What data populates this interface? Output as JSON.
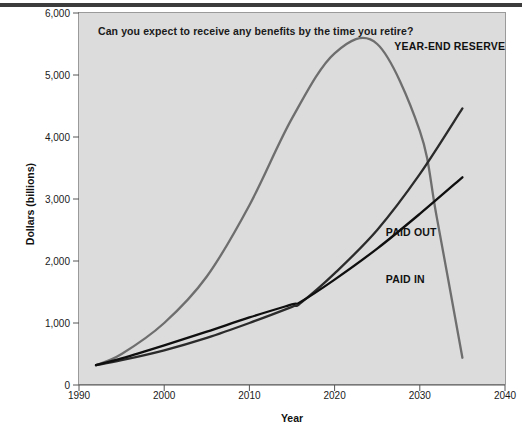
{
  "chart_data": {
    "type": "line",
    "title": "Can you expect to receive any benefits by the time you retire?",
    "xlabel": "Year",
    "ylabel": "Dollars (billions)",
    "xlim": [
      1990,
      2040
    ],
    "ylim": [
      0,
      6000
    ],
    "xticks": [
      1990,
      2000,
      2010,
      2020,
      2030,
      2040
    ],
    "xtick_labels": [
      "1990",
      "2000",
      "2010",
      "2020",
      "2030",
      "2040"
    ],
    "yticks": [
      0,
      1000,
      2000,
      3000,
      4000,
      5000,
      6000
    ],
    "ytick_labels": [
      "0",
      "1,000",
      "2,000",
      "3,000",
      "4,000",
      "5,000",
      "6,000"
    ],
    "grid": false,
    "legend_position": "inline-annotations",
    "series": [
      {
        "name": "YEAR-END RESERVE",
        "color": "#6e6e6e",
        "label_x": 2027,
        "label_y": 5450,
        "x": [
          1992,
          1995,
          2000,
          2005,
          2010,
          2015,
          2020,
          2025,
          2030,
          2032,
          2035
        ],
        "y": [
          320,
          500,
          1000,
          1750,
          2900,
          4300,
          5350,
          5500,
          4100,
          2700,
          440
        ]
      },
      {
        "name": "PAID OUT",
        "color": "#2b2b2b",
        "label_x": 2026,
        "label_y": 2450,
        "x": [
          1992,
          1995,
          2000,
          2005,
          2010,
          2015,
          2016,
          2020,
          2025,
          2030,
          2035
        ],
        "y": [
          320,
          400,
          560,
          760,
          1000,
          1260,
          1320,
          1800,
          2500,
          3400,
          4460
        ]
      },
      {
        "name": "PAID IN",
        "color": "#0f0f0f",
        "label_x": 2026,
        "label_y": 1700,
        "x": [
          1992,
          1995,
          2000,
          2005,
          2010,
          2015,
          2016,
          2020,
          2025,
          2030,
          2035
        ],
        "y": [
          320,
          430,
          640,
          860,
          1090,
          1300,
          1340,
          1700,
          2200,
          2760,
          3350
        ]
      }
    ]
  },
  "figure": {
    "background_color": "#ffffff",
    "plot_background_color": "#dcdcdc",
    "frame_color": "#9a9a9a",
    "top_rule_color": "#3c3c3c"
  }
}
